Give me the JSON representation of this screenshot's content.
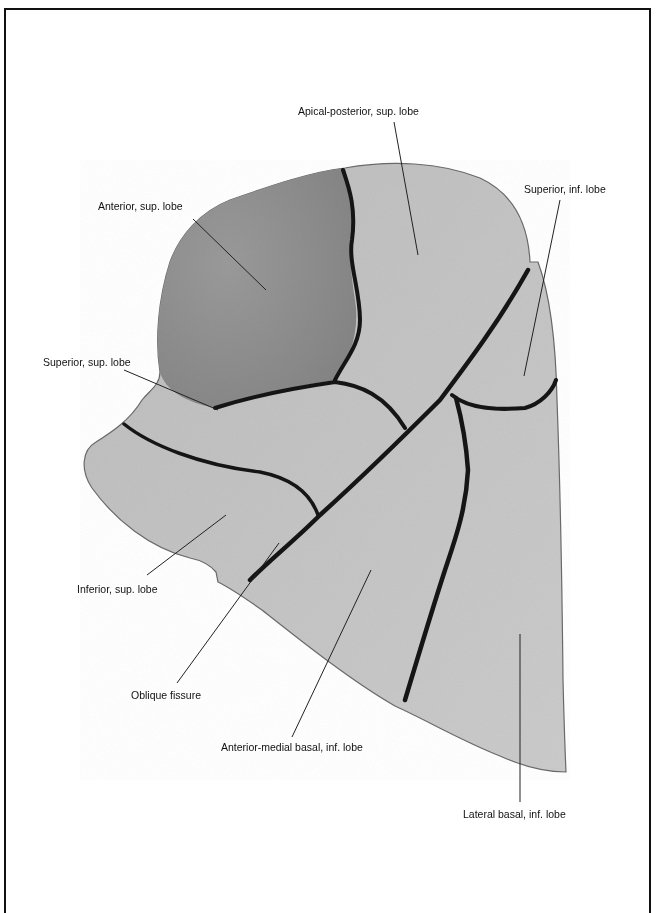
{
  "figure": {
    "colors": {
      "background": "#ffffff",
      "frame": "#111111",
      "specimen_light": "#c4c4c4",
      "specimen_dark": "#8e8e8e",
      "fissure": "#141414",
      "leader_line": "#222222",
      "label_text": "#111111"
    }
  },
  "labels": [
    {
      "id": "apical-posterior",
      "text": "Apical-posterior, sup. lobe"
    },
    {
      "id": "superior-inf",
      "text": "Superior, inf. lobe"
    },
    {
      "id": "anterior-sup",
      "text": "Anterior, sup. lobe"
    },
    {
      "id": "superior-sup",
      "text": "Superior, sup. lobe"
    },
    {
      "id": "inferior-sup",
      "text": "Inferior, sup. lobe"
    },
    {
      "id": "oblique-fissure",
      "text": "Oblique fissure"
    },
    {
      "id": "anterior-medial-basal",
      "text": "Anterior-medial basal, inf. lobe"
    },
    {
      "id": "lateral-basal",
      "text": "Lateral basal, inf. lobe"
    }
  ]
}
